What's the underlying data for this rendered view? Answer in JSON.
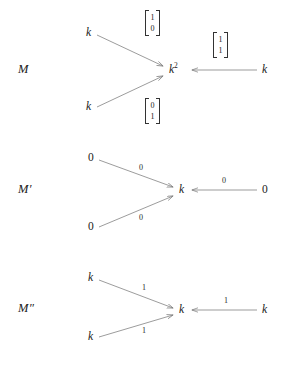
{
  "figure": {
    "background": "#ffffff",
    "line_color": "#808080",
    "text_color": "#1a1a1a",
    "rows": [
      {
        "row_label": "M",
        "center_node": "k",
        "center_exponent": "2",
        "top_left_node": "k",
        "bottom_left_node": "k",
        "right_node": "k",
        "top_edge_label_kind": "vector",
        "top_edge_vector": [
          "1",
          "0"
        ],
        "bottom_edge_label_kind": "vector",
        "bottom_edge_vector": [
          "0",
          "1"
        ],
        "right_edge_label_kind": "vector",
        "right_edge_vector": [
          "1",
          "1"
        ]
      },
      {
        "row_label": "M′",
        "center_node": "k",
        "center_exponent": "",
        "top_left_node": "0",
        "bottom_left_node": "0",
        "right_node": "0",
        "top_edge_label_kind": "scalar",
        "top_edge_scalar": "0",
        "bottom_edge_label_kind": "scalar",
        "bottom_edge_scalar": "0",
        "right_edge_label_kind": "scalar",
        "right_edge_scalar": "0"
      },
      {
        "row_label": "M″",
        "center_node": "k",
        "center_exponent": "",
        "top_left_node": "k",
        "bottom_left_node": "k",
        "right_node": "k",
        "top_edge_label_kind": "scalar",
        "top_edge_scalar": "1",
        "bottom_edge_label_kind": "scalar",
        "bottom_edge_scalar": "1",
        "right_edge_label_kind": "scalar",
        "right_edge_scalar": "1"
      }
    ]
  }
}
